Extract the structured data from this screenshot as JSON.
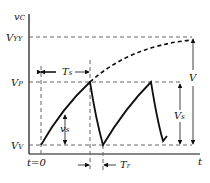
{
  "diagram": {
    "type": "waveform",
    "labels": {
      "y_axis": "vC",
      "x_axis": "t",
      "vyy": "VYY",
      "vp": "VP",
      "vv": "VV",
      "t0": "t=0",
      "ts": "Ts",
      "tr": "Tr",
      "vs_small": "vs",
      "vs_big": "Vs",
      "v": "V"
    },
    "colors": {
      "line": "#111111",
      "dashed": "#555555",
      "background": "#ffffff"
    }
  }
}
